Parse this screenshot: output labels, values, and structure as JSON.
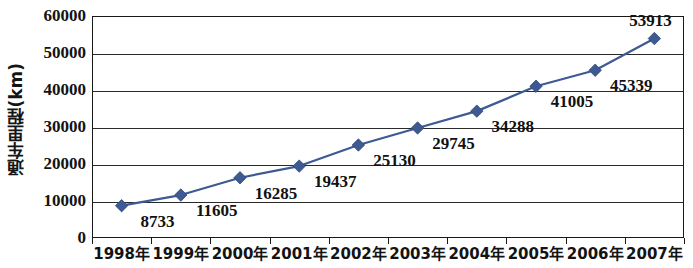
{
  "chart_data": {
    "type": "line",
    "title": "",
    "xlabel": "",
    "ylabel": "通车里程(km)",
    "ylim": [
      0,
      60000
    ],
    "ytick_labels": [
      "0",
      "10000",
      "20000",
      "30000",
      "40000",
      "50000",
      "60000"
    ],
    "ytick_values": [
      0,
      10000,
      20000,
      30000,
      40000,
      50000,
      60000
    ],
    "grid": true,
    "legend": "none",
    "marker": "diamond",
    "series_color": "#3d5a92",
    "categories": [
      "1998年",
      "1999年",
      "2000年",
      "2001年",
      "2002年",
      "2003年",
      "2004年",
      "2005年",
      "2006年",
      "2007年"
    ],
    "values": [
      8733,
      11605,
      16285,
      19437,
      25130,
      29745,
      34288,
      41005,
      45339,
      53913
    ],
    "data_labels": [
      "8733",
      "11605",
      "16285",
      "19437",
      "25130",
      "29745",
      "34288",
      "41005",
      "45339",
      "53913"
    ],
    "label_positions": [
      "below-right",
      "below-right",
      "below-right",
      "below-right",
      "below-right",
      "below-right",
      "below-right",
      "below-right",
      "below-right",
      "above-left"
    ]
  }
}
